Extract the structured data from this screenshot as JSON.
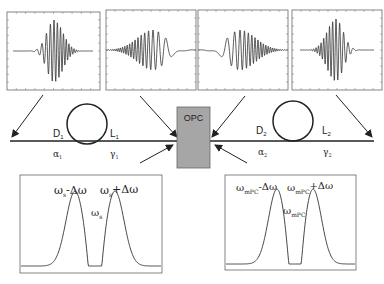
{
  "figure": {
    "type": "optical-phase-conjugation-link-schematic",
    "colors": {
      "line": "#222222",
      "panel_border": "#555555",
      "opc_fill": "#a6a6a6",
      "opc_border": "#666666",
      "background": "#ffffff"
    }
  },
  "opc": {
    "label": "OPC"
  },
  "span1": {
    "dispersion_label": "D",
    "dispersion_sub": "1",
    "length_label": "L",
    "length_sub": "1",
    "loss_label": "α",
    "loss_sub": "1",
    "nonlinearity_label": "γ",
    "nonlinearity_sub": "1"
  },
  "span2": {
    "dispersion_label": "D",
    "dispersion_sub": "2",
    "length_label": "L",
    "length_sub": "2",
    "loss_label": "α",
    "loss_sub": "2",
    "nonlinearity_label": "γ",
    "nonlinearity_sub": "2"
  },
  "pulse_panels": [
    {
      "id": "input-pulse",
      "description": "chirped pulse, compressed"
    },
    {
      "id": "span1-output-pulse",
      "description": "dispersed pulse"
    },
    {
      "id": "opc-output-pulse",
      "description": "phase-conjugated dispersed pulse"
    },
    {
      "id": "span2-output-pulse",
      "description": "recompressed pulse"
    }
  ],
  "spectrum_left": {
    "peak_left": {
      "base": "ω",
      "sub": "s",
      "suffix": "-Δω"
    },
    "peak_center": {
      "base": "ω",
      "sub": "s"
    },
    "peak_right": {
      "base": "ω",
      "sub": "s",
      "suffix": "+Δω"
    }
  },
  "spectrum_right": {
    "peak_left": {
      "base": "ω",
      "sub": "mPC",
      "suffix": "-Δω"
    },
    "peak_center": {
      "base": "ω",
      "sub": "mPC"
    },
    "peak_right": {
      "base": "ω",
      "sub": "mPC",
      "suffix": "+Δω"
    }
  }
}
